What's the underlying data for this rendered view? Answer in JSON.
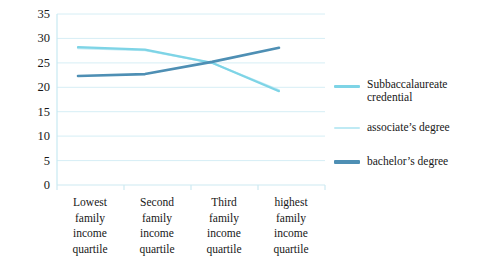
{
  "chart_data": {
    "type": "line",
    "title": "",
    "subtitle": "",
    "xlabel": "",
    "ylabel": "",
    "categories": [
      "Lowest family income quartile",
      "Second family income quartile",
      "Third family income quartile",
      "highest family income quartile"
    ],
    "category_lines": [
      [
        "Lowest",
        "family",
        "income",
        "quartile"
      ],
      [
        "Second",
        "family",
        "income",
        "quartile"
      ],
      [
        "Third",
        "family",
        "income",
        "quartile"
      ],
      [
        "highest",
        "family",
        "income",
        "quartile"
      ]
    ],
    "series": [
      {
        "name": "Subbaccalaureate credential",
        "color": "#7ED4E6",
        "width": 2.2,
        "values": [
          28.2,
          27.7,
          25.0,
          19.2
        ]
      },
      {
        "name": "associate’s degree",
        "color": "#BFEAF4",
        "width": 2.0,
        "values": [
          28.0,
          27.6,
          25.0,
          19.4
        ]
      },
      {
        "name": "bachelor’s degree",
        "color": "#4E8FB4",
        "width": 2.6,
        "values": [
          22.3,
          22.7,
          25.2,
          28.1
        ]
      }
    ],
    "ylim": [
      0,
      35
    ],
    "yticks": [
      0,
      5,
      10,
      15,
      20,
      25,
      30,
      35
    ],
    "ytick_labels": [
      "0",
      "5",
      "10",
      "15",
      "20",
      "25",
      "30",
      "35"
    ],
    "grid": true,
    "grid_color": "#D6EEF5",
    "axis_color": "#BFE3EE",
    "legend_position": "right",
    "legend": [
      "Subbaccalaureate credential",
      "associate’s degree",
      "bachelor’s degree"
    ],
    "legend_entries": [
      {
        "label_line1": "Subbaccalaureate",
        "label_line2": "credential",
        "color": "#7ED4E6",
        "thickness": "3px"
      },
      {
        "label_line1": "associate’s degree",
        "label_line2": "",
        "color": "#BFEAF4",
        "thickness": "2px"
      },
      {
        "label_line1": "bachelor’s degree",
        "label_line2": "",
        "color": "#4E8FB4",
        "thickness": "4px"
      }
    ]
  }
}
